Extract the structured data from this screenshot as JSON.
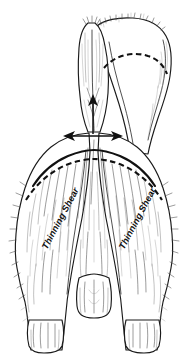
{
  "figure": {
    "title": "Rear view grooming diagram of a long-coated dog",
    "background_color": "#ffffff",
    "ink_color": "#1a1a1a",
    "guide_color": "#111111",
    "fur_color": "#4a4a4a",
    "width": 187,
    "height": 359
  },
  "labels": {
    "left_shear": "Thinning Shear",
    "right_shear": "Thinning Shear"
  },
  "annotations": {
    "guide_lines": [
      {
        "name": "rump-dashed-arc",
        "style": "dashed"
      },
      {
        "name": "upper-thigh-solid-curve",
        "style": "solid"
      },
      {
        "name": "lower-thigh-dashed-curve",
        "style": "dashed"
      }
    ],
    "arrows": [
      {
        "name": "vertical-up-arrow",
        "direction": "up"
      },
      {
        "name": "horizontal-double-arrow",
        "direction": "left-right"
      }
    ]
  },
  "parts": {
    "tail": "tail",
    "rump": "rump",
    "left_hind_leg": "left-hind-leg",
    "right_hind_leg": "right-hind-leg",
    "center_tuft": "center-tuft",
    "left_foot": "left-foot",
    "right_foot": "right-foot"
  }
}
